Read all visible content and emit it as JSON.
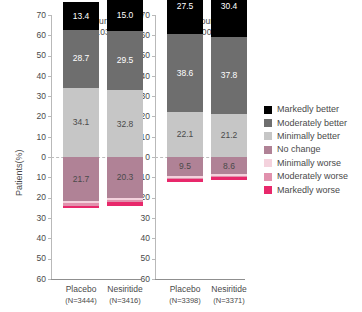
{
  "chart_data": {
    "type": "bar",
    "subtype": "diverging-stacked-bar",
    "title": "",
    "xlabel": "",
    "ylabel": "Patients(%)",
    "ylim": [
      -60,
      70
    ],
    "yticks_up": [
      0,
      10,
      20,
      30,
      40,
      50,
      70
    ],
    "grid": false,
    "legend_position": "right",
    "categories": [
      "Markedly better",
      "Moderately better",
      "Minimally better",
      "No change",
      "Minimally worse",
      "Moderately worse",
      "Markedly worse"
    ],
    "colors": [
      "#000000",
      "#6e6e6e",
      "#c6c6c6",
      "#b08296",
      "#f4d2dd",
      "#e191ad",
      "#e8286b"
    ],
    "panels": [
      {
        "title": "6 Hours",
        "pvalue": "P=0.03",
        "groups": [
          {
            "name": "Placebo",
            "n_label": "(N=3444)",
            "total_better": "42.1",
            "values": {
              "markedly_better": 13.4,
              "moderately_better": 28.7,
              "minimally_better": 34.1,
              "no_change": 21.7,
              "minimally_worse": 1.1,
              "moderately_worse": 1.1,
              "markedly_worse": 1.4
            },
            "labels": {
              "markedly_better": "13.4",
              "moderately_better": "28.7",
              "minimally_better": "34.1",
              "no_change": "21.7"
            }
          },
          {
            "name": "Nesiritide",
            "n_label": "(N=3416)",
            "total_better": "44.5",
            "values": {
              "markedly_better": 15.0,
              "moderately_better": 29.5,
              "minimally_better": 32.8,
              "no_change": 20.3,
              "minimally_worse": 1.0,
              "moderately_worse": 1.0,
              "markedly_worse": 1.8
            },
            "labels": {
              "markedly_better": "15.0",
              "moderately_better": "29.5",
              "minimally_better": "32.8",
              "no_change": "20.3"
            }
          }
        ]
      },
      {
        "title": "24 Hours",
        "pvalue": "P=0.007",
        "groups": [
          {
            "name": "Placebo",
            "n_label": "(N=3398)",
            "total_better": "66.1",
            "values": {
              "markedly_better": 27.5,
              "moderately_better": 38.6,
              "minimally_better": 22.1,
              "no_change": 9.5,
              "minimally_worse": 0.6,
              "moderately_worse": 0.6,
              "markedly_worse": 1.4
            },
            "labels": {
              "markedly_better": "27.5",
              "moderately_better": "38.6",
              "minimally_better": "22.1",
              "no_change": "9.5"
            }
          },
          {
            "name": "Nesiritide",
            "n_label": "(N=3371)",
            "total_better": "68.2",
            "values": {
              "markedly_better": 30.4,
              "moderately_better": 37.8,
              "minimally_better": 21.2,
              "no_change": 8.6,
              "minimally_worse": 0.6,
              "moderately_worse": 0.6,
              "markedly_worse": 1.4
            },
            "labels": {
              "markedly_better": "30.4",
              "moderately_better": "37.8",
              "minimally_better": "21.2",
              "no_change": "8.6"
            }
          }
        ]
      }
    ]
  },
  "axis": {
    "ylabel": "Patients(%)",
    "ticks": [
      "70",
      "60",
      "50",
      "40",
      "30",
      "20",
      "10",
      "0",
      "10",
      "20",
      "30",
      "40",
      "50",
      "60"
    ]
  },
  "legend": {
    "items": [
      {
        "label": "Markedly better",
        "color": "#000000"
      },
      {
        "label": "Moderately better",
        "color": "#6e6e6e"
      },
      {
        "label": "Minimally better",
        "color": "#c6c6c6"
      },
      {
        "label": "No change",
        "color": "#b08296"
      },
      {
        "label": "Minimally worse",
        "color": "#f4d2dd"
      },
      {
        "label": "Moderately worse",
        "color": "#e191ad"
      },
      {
        "label": "Markedly worse",
        "color": "#e8286b"
      }
    ]
  }
}
